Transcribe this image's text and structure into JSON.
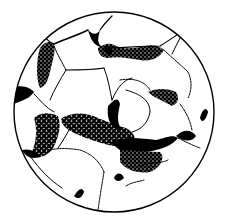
{
  "figure": {
    "description": "Circular field of view of a thin section showing interlocking grains with dark stippled intergranular cement/pore fill",
    "colors": {
      "ink": "#000000",
      "background": "#ffffff"
    },
    "field_of_view": {
      "cx": 114,
      "cy": 112,
      "r": 100
    }
  }
}
